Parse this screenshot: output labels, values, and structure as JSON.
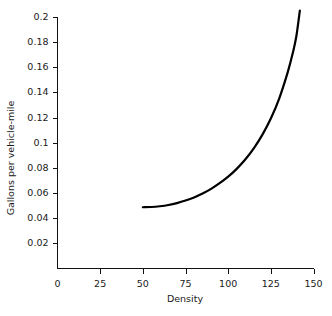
{
  "chart_data": {
    "type": "line",
    "title": "",
    "xlabel": "Density",
    "ylabel": "Gallons per vehicle-mile",
    "xlim": [
      0,
      150
    ],
    "ylim": [
      0,
      0.21
    ],
    "xticks": [
      0,
      25,
      50,
      75,
      100,
      125,
      150
    ],
    "xtick_labels": [
      "0",
      "25",
      "50",
      "75",
      "100",
      "125",
      "150"
    ],
    "yticks": [
      0.02,
      0.04,
      0.06,
      0.08,
      0.1,
      0.12,
      0.14,
      0.16,
      0.18,
      0.2
    ],
    "ytick_labels": [
      "0.02",
      "0.04",
      "0.06",
      "0.08",
      "0.1",
      "0.12",
      "0.14",
      "0.16",
      "0.18",
      "0.2"
    ],
    "grid": false,
    "legend": false,
    "legend_position": "none",
    "axis_spines": [
      "left",
      "bottom"
    ],
    "tick_direction": "out",
    "series": [
      {
        "name": "fuel consumption vs density",
        "color": "#000000",
        "linewidth": 2.2,
        "x": [
          50,
          55,
          60,
          65,
          70,
          75,
          80,
          85,
          90,
          95,
          100,
          105,
          110,
          115,
          120,
          125,
          130,
          135,
          138,
          140,
          142
        ],
        "y": [
          0.0487,
          0.0489,
          0.0495,
          0.0505,
          0.052,
          0.054,
          0.0565,
          0.0596,
          0.0633,
          0.0678,
          0.073,
          0.0792,
          0.0866,
          0.0955,
          0.1062,
          0.1192,
          0.1355,
          0.1565,
          0.172,
          0.185,
          0.205
        ]
      }
    ]
  }
}
